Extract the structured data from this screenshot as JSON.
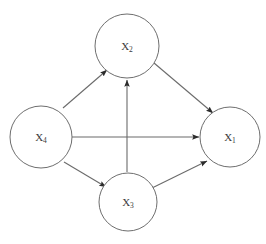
{
  "diagram": {
    "background_color": "#ffffff",
    "node_stroke_color": "#6e6e6e",
    "edge_color": "#6b6b6b",
    "label_color": "#3a3a3a",
    "nodes": [
      {
        "id": "X2",
        "base": "X",
        "subscript": "2",
        "label": "X2",
        "cx": 127,
        "cy": 46,
        "r": 32
      },
      {
        "id": "X4",
        "base": "X",
        "subscript": "4",
        "label": "X4",
        "cx": 41,
        "cy": 137,
        "r": 31
      },
      {
        "id": "X1",
        "base": "X",
        "subscript": "1",
        "label": "X1",
        "cx": 230,
        "cy": 137,
        "r": 30
      },
      {
        "id": "X3",
        "base": "X",
        "subscript": "3",
        "label": "X3",
        "cx": 128,
        "cy": 202,
        "r": 29
      }
    ],
    "edges": [
      {
        "id": "x4-to-x2",
        "from": "X4",
        "to": "X2",
        "x1": 63,
        "y1": 108,
        "x2": 107,
        "y2": 70
      },
      {
        "id": "x4-to-x1",
        "from": "X4",
        "to": "X1",
        "x1": 72,
        "y1": 137,
        "x2": 199,
        "y2": 137
      },
      {
        "id": "x4-to-x3",
        "from": "X4",
        "to": "X3",
        "x1": 64,
        "y1": 162,
        "x2": 106,
        "y2": 187
      },
      {
        "id": "x3-to-x2",
        "from": "X3",
        "to": "X2",
        "x1": 127,
        "y1": 172,
        "x2": 127,
        "y2": 80
      },
      {
        "id": "x3-to-x1",
        "from": "X3",
        "to": "X1",
        "x1": 152,
        "y1": 188,
        "x2": 207,
        "y2": 161
      },
      {
        "id": "x2-to-x1",
        "from": "X2",
        "to": "X1",
        "x1": 154,
        "y1": 63,
        "x2": 213,
        "y2": 113
      }
    ]
  }
}
